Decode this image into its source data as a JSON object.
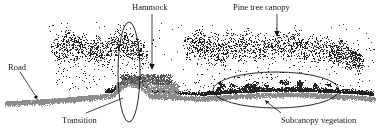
{
  "figure": {
    "kind": "lidar-point-cloud-cross-section",
    "background_color": "#ffffff",
    "width": 382,
    "height": 131,
    "labels": {
      "hammock": "Hammock",
      "pine_tree_canopy": "Pine tree canopy",
      "road": "Road",
      "transition": "Transition",
      "subcanopy_vegetation": "Subcanopy vegetation"
    },
    "colors": {
      "canopy_points": "#222222",
      "ground_points": "#8c8c8c",
      "midstory_points": "#555555",
      "annotation_stroke": "#111111",
      "label_text": "#151515"
    },
    "annotations": [
      {
        "name": "hammock-ellipse",
        "shape": "ellipse",
        "orientation": "vertical",
        "cx": 129,
        "cy": 72,
        "rx": 11,
        "ry": 50
      },
      {
        "name": "subcanopy-ellipse",
        "shape": "ellipse",
        "orientation": "horizontal",
        "cx": 276,
        "cy": 90,
        "rx": 63,
        "ry": 18
      }
    ],
    "leaders": [
      {
        "name": "hammock-arrow",
        "type": "arrow-down",
        "x1": 152,
        "y1": 14,
        "x2": 152,
        "y2": 68
      },
      {
        "name": "pine-arrow",
        "type": "arrow-down",
        "x1": 277,
        "y1": 14,
        "x2": 277,
        "y2": 36
      },
      {
        "name": "road-leader",
        "type": "line-arrow",
        "x1": 20,
        "y1": 72,
        "x2": 36,
        "y2": 97
      },
      {
        "name": "transition-leader",
        "type": "line",
        "x1": 86,
        "y1": 114,
        "x2": 122,
        "y2": 99
      },
      {
        "name": "subcanopy-leader",
        "type": "line-arrow",
        "x1": 280,
        "y1": 114,
        "x2": 266,
        "y2": 101
      }
    ]
  },
  "chart_data": {
    "type": "scatter",
    "title": "",
    "xlabel": "",
    "ylabel": "",
    "grid": false,
    "legend": "none",
    "classes": [
      {
        "name": "canopy returns",
        "color": "#222222"
      },
      {
        "name": "ground returns",
        "color": "#8c8c8c"
      },
      {
        "name": "subcanopy / midstory returns",
        "color": "#555555"
      }
    ],
    "features": [
      {
        "name": "Road",
        "x_range": [
          5,
          60
        ],
        "height": "ground level, flat bare surface"
      },
      {
        "name": "Transition",
        "x_range": [
          110,
          140
        ],
        "height": "abrupt change in vegetation structure"
      },
      {
        "name": "Hammock",
        "x_range": [
          118,
          165
        ],
        "height": "dense low-to-mid canopy mound"
      },
      {
        "name": "Pine tree canopy",
        "x_range": [
          185,
          370
        ],
        "height": "tall scattered crowns"
      },
      {
        "name": "Subcanopy vegetation",
        "x_range": [
          213,
          339
        ],
        "height": "dense returns beneath pine crowns"
      }
    ]
  }
}
